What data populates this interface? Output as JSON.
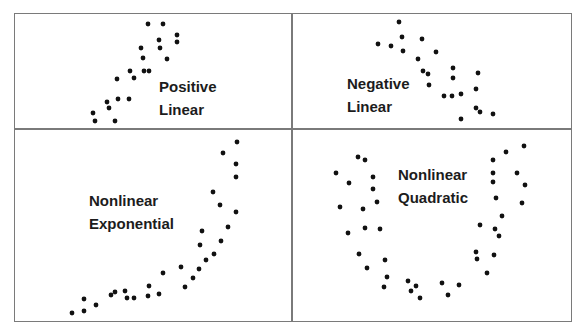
{
  "panels": [
    {
      "id": "positive-linear",
      "label_line1": "Positive",
      "label_line2": "Linear",
      "points": [
        [
          148,
          24
        ],
        [
          163,
          24
        ],
        [
          177,
          35
        ],
        [
          177,
          42
        ],
        [
          159,
          40
        ],
        [
          160,
          48
        ],
        [
          141,
          48
        ],
        [
          143,
          58
        ],
        [
          167,
          59
        ],
        [
          130,
          71
        ],
        [
          134,
          78
        ],
        [
          144,
          71
        ],
        [
          149,
          71
        ],
        [
          117,
          79
        ],
        [
          107,
          102
        ],
        [
          109,
          108
        ],
        [
          118,
          99
        ],
        [
          129,
          99
        ],
        [
          93,
          113
        ],
        [
          95,
          121
        ],
        [
          115,
          121
        ]
      ]
    },
    {
      "id": "negative-linear",
      "label_line1": "Negative",
      "label_line2": "Linear",
      "points": [
        [
          399,
          22
        ],
        [
          402,
          37
        ],
        [
          422,
          39
        ],
        [
          378,
          44
        ],
        [
          391,
          46
        ],
        [
          403,
          51
        ],
        [
          436,
          52
        ],
        [
          418,
          59
        ],
        [
          423,
          71
        ],
        [
          428,
          74
        ],
        [
          453,
          68
        ],
        [
          453,
          78
        ],
        [
          478,
          73
        ],
        [
          429,
          85
        ],
        [
          476,
          89
        ],
        [
          444,
          96
        ],
        [
          452,
          96
        ],
        [
          461,
          94
        ],
        [
          476,
          108
        ],
        [
          480,
          112
        ],
        [
          493,
          114
        ],
        [
          461,
          119
        ]
      ]
    },
    {
      "id": "nonlinear-exponential",
      "label_line1": "Nonlinear",
      "label_line2": "Exponential",
      "points": [
        [
          237,
          142
        ],
        [
          223,
          153
        ],
        [
          236,
          164
        ],
        [
          236,
          177
        ],
        [
          213,
          192
        ],
        [
          220,
          205
        ],
        [
          236,
          212
        ],
        [
          228,
          227
        ],
        [
          202,
          231
        ],
        [
          200,
          245
        ],
        [
          221,
          241
        ],
        [
          214,
          254
        ],
        [
          206,
          260
        ],
        [
          199,
          269
        ],
        [
          181,
          267
        ],
        [
          163,
          273
        ],
        [
          193,
          278
        ],
        [
          185,
          287
        ],
        [
          149,
          286
        ],
        [
          148,
          296
        ],
        [
          159,
          294
        ],
        [
          125,
          291
        ],
        [
          127,
          298
        ],
        [
          134,
          298
        ],
        [
          111,
          295
        ],
        [
          115,
          292
        ],
        [
          84,
          299
        ],
        [
          96,
          305
        ],
        [
          84,
          311
        ],
        [
          72,
          313
        ]
      ]
    },
    {
      "id": "nonlinear-quadratic",
      "label_line1": "Nonlinear",
      "label_line2": "Quadratic",
      "points": [
        [
          358,
          157
        ],
        [
          365,
          160
        ],
        [
          336,
          173
        ],
        [
          373,
          177
        ],
        [
          349,
          183
        ],
        [
          373,
          189
        ],
        [
          377,
          202
        ],
        [
          340,
          207
        ],
        [
          363,
          209
        ],
        [
          365,
          228
        ],
        [
          380,
          229
        ],
        [
          348,
          233
        ],
        [
          359,
          254
        ],
        [
          385,
          260
        ],
        [
          367,
          268
        ],
        [
          387,
          277
        ],
        [
          384,
          287
        ],
        [
          408,
          281
        ],
        [
          416,
          286
        ],
        [
          411,
          291
        ],
        [
          420,
          298
        ],
        [
          442,
          283
        ],
        [
          448,
          295
        ],
        [
          459,
          285
        ],
        [
          487,
          273
        ],
        [
          476,
          252
        ],
        [
          477,
          259
        ],
        [
          494,
          255
        ],
        [
          480,
          225
        ],
        [
          495,
          229
        ],
        [
          499,
          236
        ],
        [
          502,
          216
        ],
        [
          496,
          198
        ],
        [
          522,
          203
        ],
        [
          525,
          185
        ],
        [
          493,
          182
        ],
        [
          493,
          173
        ],
        [
          517,
          173
        ],
        [
          493,
          160
        ],
        [
          506,
          152
        ],
        [
          524,
          146
        ]
      ]
    }
  ],
  "style": {
    "dot_color": "#111111",
    "border_color": "#7a7a7a",
    "dot_radius": 2.4
  }
}
